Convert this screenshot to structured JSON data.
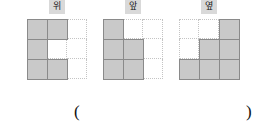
{
  "figure": {
    "type": "orthographic-views-worksheet",
    "colors": {
      "filled_cell": "#c9c9c9",
      "cell_border": "#8a8a8a",
      "guide_line": "#c4c4c4",
      "label_background": "#d9d9d9",
      "text": "#111111"
    },
    "grid": {
      "rows": 3,
      "cols": 3
    },
    "views": [
      {
        "id": "top",
        "label": "위",
        "cells": [
          [
            1,
            1,
            0
          ],
          [
            1,
            0,
            0
          ],
          [
            1,
            1,
            0
          ]
        ]
      },
      {
        "id": "front",
        "label": "앞",
        "cells": [
          [
            1,
            0,
            0
          ],
          [
            1,
            1,
            0
          ],
          [
            1,
            1,
            0
          ]
        ]
      },
      {
        "id": "side",
        "label": "옆",
        "cells": [
          [
            0,
            0,
            1
          ],
          [
            0,
            1,
            1
          ],
          [
            1,
            1,
            1
          ]
        ]
      }
    ]
  },
  "answer": {
    "open_paren": "(",
    "close_paren": ")",
    "value": ""
  }
}
